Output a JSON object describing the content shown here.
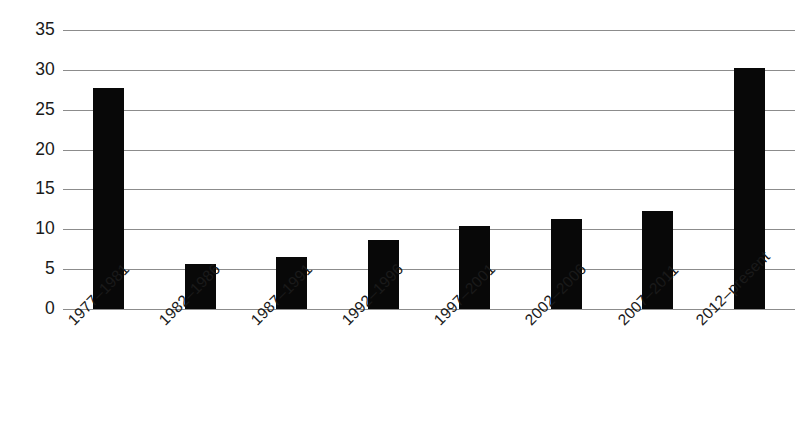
{
  "chart_data": {
    "type": "bar",
    "title": "",
    "subtitle": "",
    "xlabel": "",
    "ylabel": "",
    "categories": [
      "1977–1981",
      "1982–1986",
      "1987–1991",
      "1992–1996",
      "1997–2001",
      "2002–2006",
      "2007–2011",
      "2012–present"
    ],
    "values": [
      27.7,
      5.7,
      6.5,
      8.6,
      10.4,
      11.3,
      12.3,
      30.2
    ],
    "ylim": [
      0,
      35
    ],
    "ytick_labels": [
      "0",
      "5",
      "10",
      "15",
      "20",
      "25",
      "30",
      "35"
    ],
    "ytick_values": [
      0,
      5,
      10,
      15,
      20,
      25,
      30,
      35
    ],
    "grid": true,
    "grid_axis": "y",
    "legend": false,
    "legend_position": "none",
    "bar_color": "#080808",
    "grid_color": "#8c8c8c",
    "text_color": "#1a1a1a",
    "background_color": "#ffffff",
    "xtick_label_rotation": -45
  }
}
